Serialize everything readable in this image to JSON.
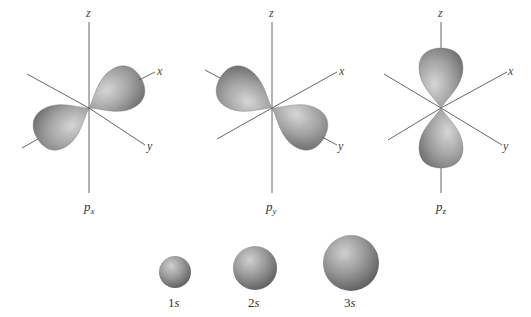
{
  "orbitals": {
    "p": [
      {
        "name": "px",
        "label_main": "p",
        "label_sub": "x",
        "axis_labels": {
          "z": "z",
          "x": "x",
          "y": "y"
        }
      },
      {
        "name": "py",
        "label_main": "p",
        "label_sub": "y",
        "axis_labels": {
          "z": "z",
          "x": "x",
          "y": "y"
        }
      },
      {
        "name": "pz",
        "label_main": "p",
        "label_sub": "z",
        "axis_labels": {
          "z": "z",
          "x": "x",
          "y": "y"
        }
      }
    ],
    "s": [
      {
        "name": "1s",
        "label_num": "1",
        "label_letter": "s"
      },
      {
        "name": "2s",
        "label_num": "2",
        "label_letter": "s"
      },
      {
        "name": "3s",
        "label_num": "3",
        "label_letter": "s"
      }
    ]
  },
  "colors": {
    "lobe": "#8a8a8a",
    "axis": "#555555",
    "background": "#ffffff"
  }
}
